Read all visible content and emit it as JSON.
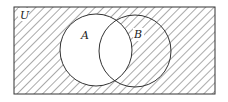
{
  "diagram": {
    "type": "venn",
    "universe_label": "U",
    "sets": [
      {
        "label": "A",
        "cx": 96,
        "cy": 50,
        "r": 36
      },
      {
        "label": "B",
        "cx": 135,
        "cy": 51,
        "r": 36
      }
    ],
    "shaded_region": "complement of A (U minus A)",
    "colors": {
      "line": "#333333",
      "hatch": "#555555",
      "background": "#ffffff"
    }
  }
}
